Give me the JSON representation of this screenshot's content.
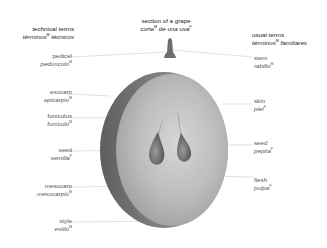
{
  "title": {
    "en": "section of a grape",
    "es": "corte",
    "es_gender": "M",
    "es_rest": " de una uva",
    "es_rest_gender": "F"
  },
  "columns": {
    "left": {
      "en": "technical terms",
      "es": "términos",
      "es_gender": "M",
      "es_rest": " técnicos"
    },
    "right": {
      "en": "usual terms",
      "es": "términos",
      "es_gender": "M",
      "es_rest": " familiares"
    }
  },
  "labels_left": [
    {
      "id": "pedicel",
      "en": "pedicel",
      "es": "pedúnculo",
      "gender": "M"
    },
    {
      "id": "exocarp",
      "en": "exocarp",
      "es": "epicarpio",
      "gender": "M"
    },
    {
      "id": "funiculus",
      "en": "funiculus",
      "es": "funículo",
      "gender": "M"
    },
    {
      "id": "seed-left",
      "en": "seed",
      "es": "semilla",
      "gender": "F"
    },
    {
      "id": "mesocarp",
      "en": "mesocarp",
      "es": "mesocarpio",
      "gender": "M"
    },
    {
      "id": "style",
      "en": "style",
      "es": "estilo",
      "gender": "M"
    }
  ],
  "labels_right": [
    {
      "id": "stem",
      "en": "stem",
      "es": "rabillo",
      "gender": "M"
    },
    {
      "id": "skin",
      "en": "skin",
      "es": "piel",
      "gender": "F"
    },
    {
      "id": "seed-right",
      "en": "seed",
      "es": "pepita",
      "gender": "F"
    },
    {
      "id": "flesh",
      "en": "flesh",
      "es": "pulpa",
      "gender": "F"
    }
  ],
  "colors": {
    "background": "#ffffff",
    "leader_line": "#cfcfcf",
    "grape_light": "#c8c8c8",
    "grape_dark": "#6a6a6a",
    "text_header": "#222222",
    "text_label": "#555555"
  }
}
